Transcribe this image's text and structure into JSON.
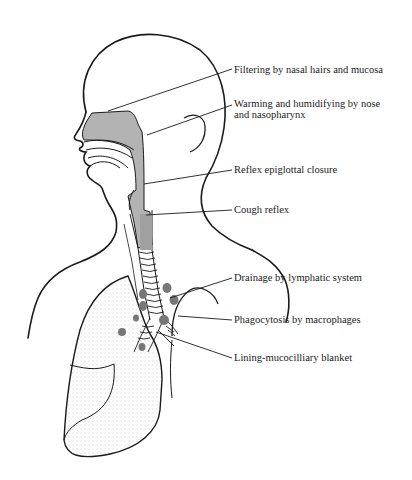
{
  "diagram": {
    "colors": {
      "line": "#1a1a1a",
      "shade": "#b3b3b3",
      "node": "#777777",
      "stipple": "#9a9a9a"
    },
    "labels": [
      {
        "id": "filtering",
        "text": "Filtering by nasal hairs and mucosa"
      },
      {
        "id": "warming-1",
        "text": "Warming and humidifying by nose"
      },
      {
        "id": "warming-2",
        "text": "and nasopharynx"
      },
      {
        "id": "epiglottal",
        "text": "Reflex epiglottal closure"
      },
      {
        "id": "cough",
        "text": "Cough reflex"
      },
      {
        "id": "drainage",
        "text": "Drainage by lymphatic system"
      },
      {
        "id": "phagocytosis",
        "text": "Phagocytosis by macrophages"
      },
      {
        "id": "lining",
        "text": "Lining-mucocilliary blanket"
      }
    ]
  }
}
